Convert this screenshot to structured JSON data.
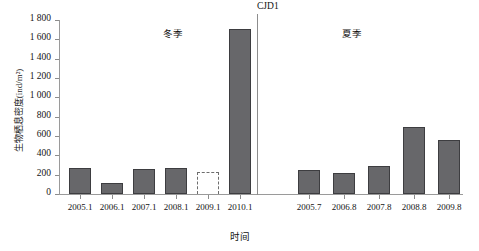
{
  "chart_data": {
    "type": "bar",
    "title": "",
    "xlabel": "时间",
    "ylabel": "生物栖息密度(ind/m²)",
    "ylim": [
      0,
      1800
    ],
    "ytick_labels": [
      "0",
      "200",
      "400",
      "600",
      "800",
      "1 000",
      "1 200",
      "1 400",
      "1 600",
      "1 800"
    ],
    "ytick_values": [
      0,
      200,
      400,
      600,
      800,
      1000,
      1200,
      1400,
      1600,
      1800
    ],
    "grid": false,
    "legend": "none",
    "categories": [
      "2005.1",
      "2006.1",
      "2007.1",
      "2008.1",
      "2009.1",
      "2010.1",
      "2005.7",
      "2006.8",
      "2007.8",
      "2008.8",
      "2009.8"
    ],
    "values": [
      265,
      110,
      255,
      265,
      230,
      1710,
      245,
      215,
      290,
      695,
      560
    ],
    "bar_styles": [
      "solid",
      "solid",
      "solid",
      "solid",
      "dashed",
      "solid",
      "solid",
      "solid",
      "solid",
      "solid",
      "solid"
    ],
    "annotations": [
      {
        "name": "winter-group-label",
        "text": "冬季"
      },
      {
        "name": "summer-group-label",
        "text": "夏季"
      },
      {
        "name": "station-label",
        "text": "CJD1"
      }
    ],
    "separator_after_category": "2010.1",
    "colors": {
      "bar_fill": "#67676a",
      "bar_edge": "#3d3d40",
      "dashed_edge": "#6d6d6d",
      "axis": "#9a9a9a",
      "text": "#141414",
      "background": "#ffffff"
    }
  }
}
